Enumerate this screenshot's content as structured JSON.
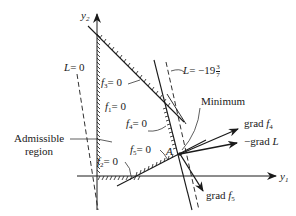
{
  "figure": {
    "type": "linear-programming feasible region diagram",
    "axes": {
      "x_label": "y",
      "x_sub": "1",
      "y_label": "y",
      "y_sub": "2"
    },
    "constraints": [
      {
        "name": "f",
        "sub": "1",
        "eq": "= 0"
      },
      {
        "name": "f",
        "sub": "2",
        "eq": "= 0"
      },
      {
        "name": "f",
        "sub": "3",
        "eq": "= 0"
      },
      {
        "name": "f",
        "sub": "4",
        "eq": "= 0"
      },
      {
        "name": "f",
        "sub": "5",
        "eq": "= 0"
      }
    ],
    "objective_lines": [
      {
        "label": "L",
        "eq": "= 0"
      },
      {
        "label": "L",
        "eq": "= −19",
        "frac_num": "3",
        "frac_den": "7"
      }
    ],
    "annotations": {
      "minimum": "Minimum",
      "admissible_line1": "Admissible",
      "admissible_line2": "region",
      "point": "A"
    },
    "vectors": [
      {
        "prefix": "grad ",
        "name": "f",
        "sub": "4"
      },
      {
        "prefix": "−grad ",
        "name": "L",
        "sub": ""
      },
      {
        "prefix": "grad ",
        "name": "f",
        "sub": "5"
      }
    ],
    "colors": {
      "ink": "#1a1a1a",
      "background": "#ffffff"
    }
  }
}
